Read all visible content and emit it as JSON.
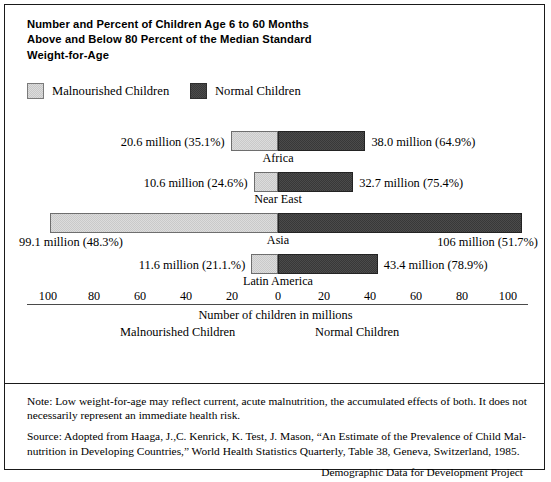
{
  "title_lines": [
    "Number and Percent of Children Age 6 to 60 Months",
    "Above and Below 80 Percent of the Median Standard",
    "Weight-for-Age"
  ],
  "legend": {
    "malnourished": "Malnourished Children",
    "normal": "Normal Children"
  },
  "axis": {
    "caption": "Number of children in millions",
    "sub_left": "Malnourished Children",
    "sub_right": "Normal Children",
    "ticks": [
      "100",
      "80",
      "60",
      "40",
      "20",
      "0",
      "20",
      "40",
      "60",
      "80",
      "100"
    ]
  },
  "footer": {
    "note": "Note:  Low weight-for-age may reflect current, acute malnutrition, the accumulated effects of both. It does not necessarily represent an immediate health risk.",
    "source": "Source: Adopted from Haaga, J.,C. Kenrick, K. Test, J. Mason, “An Estimate of the Prevalence of Child Mal-nutrition in Developing Countries,” World Health Statistics Quarterly, Table 38, Geneva, Switzerland, 1985.",
    "credit": "Demographic Data for Development Project"
  },
  "colors": {
    "malnourished": "#dcdcdc",
    "normal": "#4b4b4b",
    "frame": "#1a1a1a",
    "axis": "#4a4a4a"
  },
  "chart_data": {
    "type": "bar",
    "orientation": "horizontal",
    "layout": "diverging-stacked",
    "title": "Number and Percent of Children Age 6 to 60 Months Above and Below 80 Percent of the Median Standard Weight-for-Age",
    "xlabel": "Number of children in millions",
    "ylabel": "",
    "xlim": [
      -110,
      110
    ],
    "xticks": [
      -100,
      -80,
      -60,
      -40,
      -20,
      0,
      20,
      40,
      60,
      80,
      100
    ],
    "xticklabels": [
      "100",
      "80",
      "60",
      "40",
      "20",
      "0",
      "20",
      "40",
      "60",
      "80",
      "100"
    ],
    "grid": false,
    "legend": [
      "Malnourished Children",
      "Normal Children"
    ],
    "legend_position": "top-left",
    "categories": [
      "Africa",
      "Near East",
      "Asia",
      "Latin America"
    ],
    "series": [
      {
        "name": "Malnourished Children",
        "direction": "left",
        "values": [
          20.6,
          10.6,
          99.1,
          11.6
        ],
        "percents": [
          35.1,
          24.6,
          48.3,
          21.1
        ],
        "labels": [
          "20.6 million (35.1%)",
          "10.6 million (24.6%)",
          "99.1 million (48.3%)",
          "11.6 million (21.1.%)"
        ]
      },
      {
        "name": "Normal Children",
        "direction": "right",
        "values": [
          38.0,
          32.7,
          106.0,
          43.4
        ],
        "percents": [
          64.9,
          75.4,
          51.7,
          78.9
        ],
        "labels": [
          "38.0 million (64.9%)",
          "32.7 million (75.4%)",
          "106 million (51.7%)",
          "43.4 million (78.9%)"
        ]
      }
    ]
  }
}
